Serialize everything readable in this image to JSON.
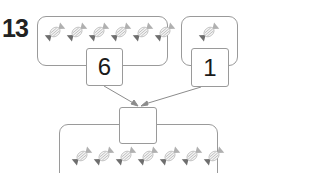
{
  "question": {
    "number": "13"
  },
  "parts": [
    {
      "candy_count": 6,
      "value": "6"
    },
    {
      "candy_count": 1,
      "value": "1"
    }
  ],
  "whole": {
    "candy_count": 7,
    "value": ""
  },
  "icons": {
    "candy": "wrapped-candy-icon"
  },
  "colors": {
    "border": "#9a9a9a",
    "candy_dark": "#6e6e6e",
    "candy_light": "#b0b0b0",
    "text": "#1a1a1a"
  }
}
